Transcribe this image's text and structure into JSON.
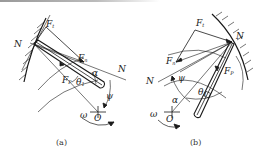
{
  "figure": {
    "panels": [
      {
        "id": "a",
        "caption": "(a)",
        "labels": {
          "N_left": "N",
          "N_right": "N",
          "Ft": "F",
          "Ft_sub": "t",
          "Fn": "F",
          "Fn_sub": "n",
          "Fp": "F",
          "Fp_sub": "P",
          "alpha": "α",
          "theta": "θ",
          "theta_sub": "1",
          "psi": "ψ",
          "omega": "ω",
          "O": "O"
        }
      },
      {
        "id": "b",
        "caption": "(b)",
        "labels": {
          "N_left": "N",
          "N_right": "N",
          "Ft": "F",
          "Ft_sub": "t",
          "Fn": "F",
          "Fn_sub": "n",
          "Fp": "F",
          "Fp_sub": "P",
          "alpha": "α",
          "theta": "θ",
          "theta_sub": "1",
          "psi": "ψ",
          "omega": "ω",
          "O": "O"
        }
      }
    ],
    "colors": {
      "line": "#1a1a1a",
      "background": "#ffffff"
    }
  }
}
